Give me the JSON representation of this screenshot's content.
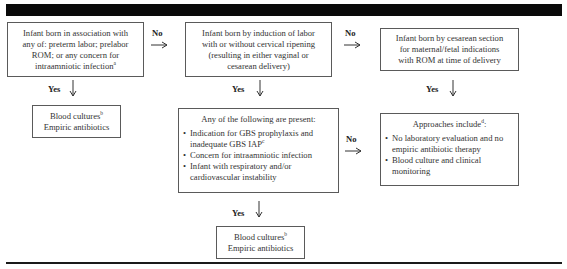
{
  "figure": {
    "header_band_color": "#0a0a0a",
    "border_color": "#5a5a5a"
  },
  "nodes": {
    "start": {
      "lines": [
        "Infant born in association with",
        "any of: preterm labor; prelabor",
        "ROM; or any concern for",
        "intraamniotic infection"
      ],
      "footnote": "a"
    },
    "induction": {
      "lines": [
        "Infant born by induction of labor",
        "with or without cervical ripening",
        "(resulting in either vaginal or",
        "cesarean delivery)"
      ]
    },
    "cesarean": {
      "lines": [
        "Infant born by cesarean section",
        "for maternal/fetal indications",
        "with ROM at time of delivery"
      ]
    },
    "criteria": {
      "title": "Any of the following are present:",
      "items": [
        {
          "text": "Indication for GBS prophylaxis and inadequate GBS IAP",
          "footnote": "c"
        },
        {
          "text": "Concern for intraamniotic infection",
          "footnote": ""
        },
        {
          "text": "Infant with respiratory and/or cardiovascular instability",
          "footnote": ""
        }
      ]
    },
    "approaches": {
      "title": "Approaches include",
      "title_footnote": "d",
      "title_suffix": ":",
      "items": [
        {
          "text": "No laboratory evaluation and no empiric antibiotic therapy"
        },
        {
          "text": "Blood culture and clinical monitoring"
        }
      ]
    },
    "action_1": {
      "line1": "Blood cultures",
      "footnote": "b",
      "line2": "Empiric antibiotics"
    },
    "action_2": {
      "line1": "Blood cultures",
      "footnote": "b",
      "line2": "Empiric antibiotics"
    }
  },
  "edges": {
    "start_to_induction": "No",
    "induction_to_cesarean": "No",
    "criteria_to_approaches": "No",
    "start_to_action1": "Yes",
    "induction_to_criteria": "Yes",
    "cesarean_to_approaches": "Yes",
    "criteria_to_action2": "Yes"
  }
}
